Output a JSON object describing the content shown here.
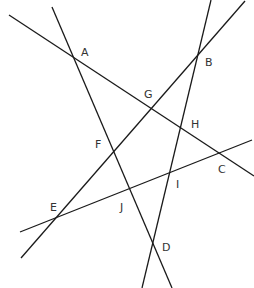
{
  "diagram": {
    "title": "",
    "line_color": "#1a1a1a",
    "label_color": "#333333",
    "lines": [
      {
        "id": "line-AGHC",
        "x1": 9,
        "y1": 15,
        "x2": 254,
        "y2": 176
      },
      {
        "id": "line-AFJD",
        "x1": 52,
        "y1": 7,
        "x2": 172,
        "y2": 288
      },
      {
        "id": "line-EFGB",
        "x1": 21,
        "y1": 258,
        "x2": 245,
        "y2": 1
      },
      {
        "id": "line-BHID",
        "x1": 211,
        "y1": 0,
        "x2": 142,
        "y2": 288
      },
      {
        "id": "line-EJIC",
        "x1": 20,
        "y1": 232,
        "x2": 252,
        "y2": 140
      }
    ],
    "points": [
      {
        "label": "A",
        "x": 81,
        "y": 56
      },
      {
        "label": "B",
        "x": 205,
        "y": 66
      },
      {
        "label": "G",
        "x": 144,
        "y": 98
      },
      {
        "label": "H",
        "x": 191,
        "y": 128
      },
      {
        "label": "F",
        "x": 95,
        "y": 148
      },
      {
        "label": "C",
        "x": 218,
        "y": 173
      },
      {
        "label": "I",
        "x": 176,
        "y": 188
      },
      {
        "label": "E",
        "x": 50,
        "y": 211
      },
      {
        "label": "J",
        "x": 120,
        "y": 211
      },
      {
        "label": "D",
        "x": 162,
        "y": 251
      }
    ]
  }
}
